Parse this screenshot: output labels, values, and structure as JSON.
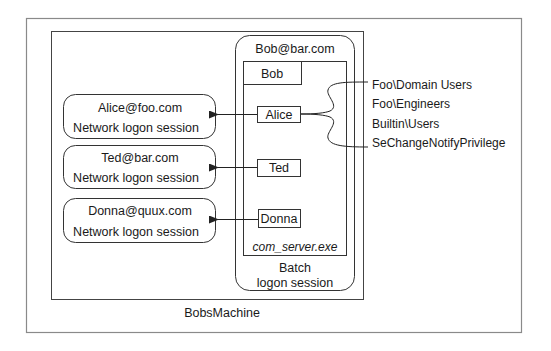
{
  "machine": {
    "label": "BobsMachine"
  },
  "batch_session": {
    "account": "Bob@bar.com",
    "caption_line1": "Batch",
    "caption_line2": "logon session",
    "process": {
      "name": "com_server.exe",
      "primary_token": "Bob",
      "threads": [
        {
          "label": "Alice"
        },
        {
          "label": "Ted"
        },
        {
          "label": "Donna"
        }
      ]
    }
  },
  "network_sessions": [
    {
      "account": "Alice@foo.com",
      "type": "Network logon session"
    },
    {
      "account": "Ted@bar.com",
      "type": "Network logon session"
    },
    {
      "account": "Donna@quux.com",
      "type": "Network logon session"
    }
  ],
  "alice_token_contents": [
    "Foo\\Domain Users",
    "Foo\\Engineers",
    "Builtin\\Users",
    "SeChangeNotifyPrivilege"
  ],
  "colors": {
    "frame": "#8a8a8a",
    "stroke": "#333333",
    "text": "#1a1a1a",
    "background": "#ffffff"
  }
}
